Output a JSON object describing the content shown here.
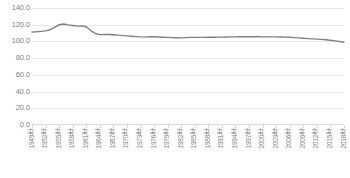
{
  "chart_data": {
    "type": "line",
    "title": "",
    "subtitle": "",
    "xlabel": "",
    "ylabel": "",
    "ylim": [
      0.0,
      140.0
    ],
    "y_ticks": [
      "0.0",
      "20.0",
      "40.0",
      "60.0",
      "80.0",
      "100.0",
      "120.0",
      "140.0"
    ],
    "y_tick_values": [
      0.0,
      20.0,
      40.0,
      60.0,
      80.0,
      100.0,
      120.0,
      140.0
    ],
    "grid": true,
    "legend": false,
    "legend_position": "none",
    "line_color": "#808080",
    "grid_color": "#e6e6e6",
    "tick_label_color": "#7f7f7f",
    "x_tick_labels": [
      "1949年",
      "1952年",
      "1955年",
      "1958年",
      "1961年",
      "1964年",
      "1967年",
      "1970年",
      "1973年",
      "1976年",
      "1979年",
      "1982年",
      "1985年",
      "1988年",
      "1991年",
      "1994年",
      "1997年",
      "2000年",
      "2003年",
      "2006年",
      "2009年",
      "2012年",
      "2015年",
      "2018年"
    ],
    "x": [
      1949,
      1950,
      1951,
      1952,
      1953,
      1954,
      1955,
      1956,
      1957,
      1958,
      1959,
      1960,
      1961,
      1962,
      1963,
      1964,
      1965,
      1966,
      1967,
      1968,
      1969,
      1970,
      1971,
      1972,
      1973,
      1974,
      1975,
      1976,
      1977,
      1978,
      1979,
      1980,
      1981,
      1982,
      1983,
      1984,
      1985,
      1986,
      1987,
      1988,
      1989,
      1990,
      1991,
      1992,
      1993,
      1994,
      1995,
      1996,
      1997,
      1998,
      1999,
      2000,
      2001,
      2002,
      2003,
      2004,
      2005,
      2006,
      2007,
      2008,
      2009,
      2010,
      2011,
      2012,
      2013,
      2014,
      2015,
      2016,
      2017,
      2018
    ],
    "series": [
      {
        "name": "",
        "values": [
          111.3,
          111.5,
          112.0,
          112.6,
          114.0,
          116.8,
          120.0,
          120.8,
          119.8,
          119.0,
          118.3,
          118.4,
          117.5,
          113.0,
          109.5,
          108.2,
          108.4,
          108.3,
          108.0,
          107.5,
          107.0,
          106.6,
          106.2,
          105.8,
          105.4,
          105.2,
          105.7,
          105.6,
          105.3,
          105.0,
          104.8,
          104.6,
          104.4,
          104.3,
          104.6,
          104.8,
          104.8,
          104.8,
          104.9,
          105.0,
          105.0,
          105.1,
          105.2,
          105.3,
          105.4,
          105.5,
          105.6,
          105.6,
          105.6,
          105.6,
          105.6,
          105.5,
          105.5,
          105.4,
          105.4,
          105.3,
          105.2,
          105.0,
          104.6,
          104.2,
          103.8,
          103.4,
          103.0,
          102.7,
          102.4,
          102.0,
          101.4,
          100.7,
          99.9,
          99.0
        ]
      }
    ]
  }
}
